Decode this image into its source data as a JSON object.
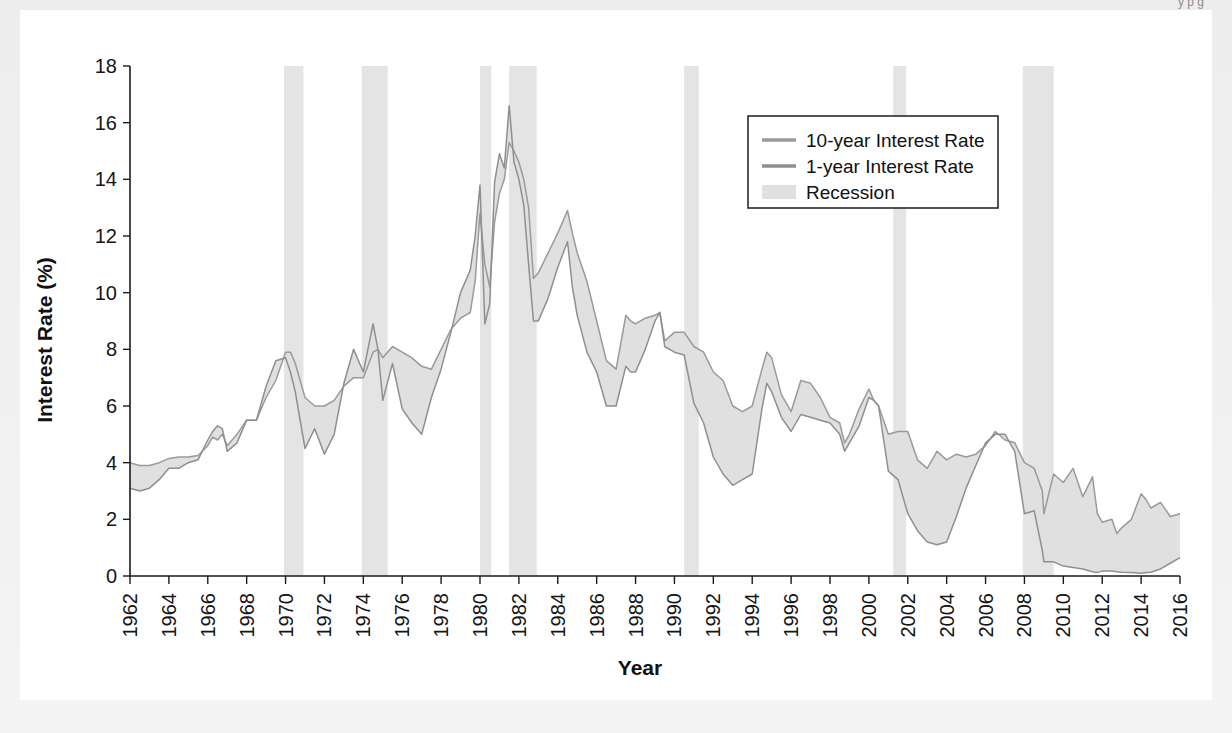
{
  "caption": "y                               p   g            ",
  "colors": {
    "page_background": "#f0f0f0",
    "card_background": "#ffffff",
    "axis": "#1b1b1b",
    "text": "#111111",
    "series_10y": "#9a9a9a",
    "series_1y": "#8f8f8f",
    "band_fill": "#e0e0e0",
    "recession": "#e4e4e4",
    "legend_border": "#2a2a2a"
  },
  "legend": {
    "position": "upper-right",
    "entries": [
      {
        "label": "10-year Interest Rate",
        "marker": "line",
        "color": "#9a9a9a"
      },
      {
        "label": "1-year Interest Rate",
        "marker": "line",
        "color": "#8f8f8f"
      },
      {
        "label": "Recession",
        "marker": "patch",
        "color": "#e0e0e0"
      }
    ]
  },
  "chart_data": {
    "type": "line",
    "title": "",
    "xlabel": "Year",
    "ylabel": "Interest Rate (%)",
    "xlim": [
      1962,
      2016
    ],
    "ylim": [
      0,
      18
    ],
    "grid": false,
    "xticks": [
      1962,
      1964,
      1966,
      1968,
      1970,
      1972,
      1974,
      1976,
      1978,
      1980,
      1982,
      1984,
      1986,
      1988,
      1990,
      1992,
      1994,
      1996,
      1998,
      2000,
      2002,
      2004,
      2006,
      2008,
      2010,
      2012,
      2014,
      2016
    ],
    "xtick_labels": [
      "1962",
      "1964",
      "1966",
      "1968",
      "1970",
      "1972",
      "1974",
      "1976",
      "1978",
      "1980",
      "1982",
      "1984",
      "1986",
      "1988",
      "1990",
      "1992",
      "1994",
      "1996",
      "1998",
      "2000",
      "2002",
      "2004",
      "2006",
      "2008",
      "2010",
      "2012",
      "2014",
      "2016"
    ],
    "yticks": [
      0,
      2,
      4,
      6,
      8,
      10,
      12,
      14,
      16,
      18
    ],
    "ytick_labels": [
      "0",
      "2",
      "4",
      "6",
      "8",
      "10",
      "12",
      "14",
      "16",
      "18"
    ],
    "recessions": [
      {
        "start": 1969.92,
        "end": 1970.92
      },
      {
        "start": 1973.92,
        "end": 1975.25
      },
      {
        "start": 1980.0,
        "end": 1980.58
      },
      {
        "start": 1981.5,
        "end": 1982.92
      },
      {
        "start": 1990.5,
        "end": 1991.25
      },
      {
        "start": 2001.25,
        "end": 2001.92
      },
      {
        "start": 2007.92,
        "end": 2009.5
      }
    ],
    "series": [
      {
        "name": "10-year Interest Rate",
        "color": "#9a9a9a",
        "x": [
          1962.0,
          1962.5,
          1963.0,
          1963.5,
          1964.0,
          1964.5,
          1965.0,
          1965.5,
          1966.0,
          1966.25,
          1966.5,
          1966.75,
          1967.0,
          1967.5,
          1968.0,
          1968.5,
          1969.0,
          1969.5,
          1970.0,
          1970.25,
          1970.5,
          1971.0,
          1971.5,
          1972.0,
          1972.5,
          1973.0,
          1973.5,
          1974.0,
          1974.5,
          1974.75,
          1975.0,
          1975.5,
          1976.0,
          1976.5,
          1977.0,
          1977.5,
          1978.0,
          1978.5,
          1979.0,
          1979.5,
          1979.75,
          1980.0,
          1980.25,
          1980.5,
          1980.75,
          1981.0,
          1981.25,
          1981.5,
          1981.75,
          1982.0,
          1982.25,
          1982.5,
          1982.75,
          1983.0,
          1983.5,
          1984.0,
          1984.5,
          1984.75,
          1985.0,
          1985.5,
          1986.0,
          1986.5,
          1987.0,
          1987.5,
          1987.75,
          1988.0,
          1988.5,
          1989.0,
          1989.25,
          1989.5,
          1990.0,
          1990.5,
          1991.0,
          1991.5,
          1992.0,
          1992.5,
          1993.0,
          1993.5,
          1994.0,
          1994.5,
          1994.75,
          1995.0,
          1995.5,
          1996.0,
          1996.5,
          1997.0,
          1997.5,
          1998.0,
          1998.5,
          1998.75,
          1999.0,
          1999.5,
          2000.0,
          2000.25,
          2000.5,
          2001.0,
          2001.5,
          2002.0,
          2002.5,
          2003.0,
          2003.5,
          2004.0,
          2004.5,
          2005.0,
          2005.5,
          2006.0,
          2006.5,
          2007.0,
          2007.5,
          2008.0,
          2008.5,
          2008.92,
          2009.0,
          2009.5,
          2010.0,
          2010.5,
          2011.0,
          2011.5,
          2011.75,
          2012.0,
          2012.5,
          2012.75,
          2013.0,
          2013.5,
          2014.0,
          2014.25,
          2014.5,
          2015.0,
          2015.5,
          2016.0
        ],
        "y": [
          4.0,
          3.9,
          3.9,
          4.0,
          4.15,
          4.2,
          4.2,
          4.25,
          4.6,
          4.9,
          4.8,
          5.0,
          4.6,
          5.0,
          5.5,
          5.5,
          6.3,
          6.9,
          7.9,
          7.9,
          7.5,
          6.3,
          6.0,
          6.0,
          6.2,
          6.7,
          7.0,
          7.0,
          7.9,
          8.0,
          7.7,
          8.1,
          7.9,
          7.7,
          7.4,
          7.3,
          8.0,
          8.7,
          9.1,
          9.3,
          10.4,
          12.8,
          11.0,
          10.2,
          12.5,
          13.5,
          14.0,
          15.3,
          15.0,
          14.6,
          14.0,
          13.0,
          10.5,
          10.7,
          11.4,
          12.1,
          12.9,
          12.1,
          11.4,
          10.4,
          9.0,
          7.6,
          7.3,
          9.2,
          9.0,
          8.9,
          9.1,
          9.2,
          9.3,
          8.3,
          8.6,
          8.6,
          8.1,
          7.9,
          7.2,
          6.9,
          6.0,
          5.8,
          6.0,
          7.3,
          7.9,
          7.7,
          6.4,
          5.8,
          6.9,
          6.8,
          6.3,
          5.6,
          5.4,
          4.7,
          5.0,
          5.9,
          6.6,
          6.2,
          6.0,
          5.0,
          5.1,
          5.1,
          4.1,
          3.8,
          4.4,
          4.1,
          4.3,
          4.2,
          4.3,
          4.6,
          5.1,
          4.8,
          4.7,
          4.0,
          3.8,
          3.0,
          2.2,
          3.6,
          3.3,
          3.8,
          2.8,
          3.5,
          2.2,
          1.9,
          2.0,
          1.5,
          1.7,
          2.0,
          2.9,
          2.7,
          2.4,
          2.6,
          2.1,
          2.2
        ]
      },
      {
        "name": "1-year Interest Rate",
        "color": "#8f8f8f",
        "x": [
          1962.0,
          1962.5,
          1963.0,
          1963.5,
          1964.0,
          1964.5,
          1965.0,
          1965.5,
          1966.0,
          1966.25,
          1966.5,
          1966.75,
          1967.0,
          1967.5,
          1968.0,
          1968.5,
          1969.0,
          1969.5,
          1970.0,
          1970.25,
          1970.5,
          1971.0,
          1971.5,
          1972.0,
          1972.5,
          1973.0,
          1973.5,
          1974.0,
          1974.5,
          1974.75,
          1975.0,
          1975.5,
          1976.0,
          1976.5,
          1977.0,
          1977.5,
          1978.0,
          1978.5,
          1979.0,
          1979.5,
          1979.75,
          1980.0,
          1980.25,
          1980.5,
          1980.75,
          1981.0,
          1981.25,
          1981.5,
          1981.75,
          1982.0,
          1982.25,
          1982.5,
          1982.75,
          1983.0,
          1983.5,
          1984.0,
          1984.5,
          1984.75,
          1985.0,
          1985.5,
          1986.0,
          1986.5,
          1987.0,
          1987.5,
          1987.75,
          1988.0,
          1988.5,
          1989.0,
          1989.25,
          1989.5,
          1990.0,
          1990.5,
          1991.0,
          1991.5,
          1992.0,
          1992.5,
          1993.0,
          1993.5,
          1994.0,
          1994.5,
          1994.75,
          1995.0,
          1995.5,
          1996.0,
          1996.5,
          1997.0,
          1997.5,
          1998.0,
          1998.5,
          1998.75,
          1999.0,
          1999.5,
          2000.0,
          2000.25,
          2000.5,
          2001.0,
          2001.5,
          2002.0,
          2002.5,
          2003.0,
          2003.5,
          2004.0,
          2004.5,
          2005.0,
          2005.5,
          2006.0,
          2006.5,
          2007.0,
          2007.5,
          2008.0,
          2008.5,
          2008.92,
          2009.0,
          2009.5,
          2010.0,
          2010.5,
          2011.0,
          2011.5,
          2011.75,
          2012.0,
          2012.5,
          2012.75,
          2013.0,
          2013.5,
          2014.0,
          2014.25,
          2014.5,
          2015.0,
          2015.5,
          2016.0
        ],
        "y": [
          3.1,
          3.0,
          3.1,
          3.4,
          3.8,
          3.8,
          4.0,
          4.1,
          4.8,
          5.1,
          5.3,
          5.2,
          4.4,
          4.7,
          5.5,
          5.5,
          6.7,
          7.6,
          7.7,
          7.2,
          6.5,
          4.5,
          5.2,
          4.3,
          5.0,
          6.8,
          8.0,
          7.2,
          8.9,
          8.0,
          6.2,
          7.5,
          5.9,
          5.4,
          5.0,
          6.3,
          7.3,
          8.6,
          10.0,
          10.8,
          12.0,
          13.8,
          8.9,
          9.6,
          13.9,
          14.9,
          14.4,
          16.6,
          14.6,
          14.0,
          13.1,
          11.0,
          9.0,
          9.0,
          9.8,
          10.9,
          11.8,
          10.2,
          9.2,
          7.9,
          7.2,
          6.0,
          6.0,
          7.4,
          7.2,
          7.2,
          8.0,
          9.0,
          9.3,
          8.1,
          7.9,
          7.8,
          6.1,
          5.4,
          4.2,
          3.6,
          3.2,
          3.4,
          3.6,
          5.9,
          6.8,
          6.5,
          5.6,
          5.1,
          5.7,
          5.6,
          5.5,
          5.4,
          5.0,
          4.4,
          4.7,
          5.3,
          6.3,
          6.2,
          6.0,
          3.7,
          3.4,
          2.2,
          1.6,
          1.2,
          1.1,
          1.2,
          2.1,
          3.1,
          3.9,
          4.7,
          5.0,
          5.0,
          4.4,
          2.2,
          2.3,
          0.9,
          0.5,
          0.5,
          0.35,
          0.3,
          0.25,
          0.15,
          0.12,
          0.18,
          0.18,
          0.15,
          0.13,
          0.12,
          0.1,
          0.12,
          0.13,
          0.25,
          0.45,
          0.65
        ]
      }
    ]
  }
}
